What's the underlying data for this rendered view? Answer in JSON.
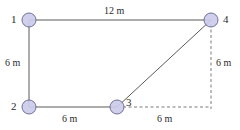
{
  "figure": {
    "units": "m",
    "colors": {
      "node_fill": "#ccccec",
      "node_stroke": "#6f6f9c",
      "member_line": "#5a5a5a",
      "dimension_line": "#7a7a7a",
      "label_text": "#2b2b2b",
      "background": "#ffffff"
    }
  },
  "nodes": [
    {
      "id": "1",
      "label": "1",
      "x": 29,
      "y": 20,
      "r": 7,
      "label_x": 11,
      "label_y": 14
    },
    {
      "id": "2",
      "label": "2",
      "x": 29,
      "y": 107,
      "r": 7,
      "label_x": 11,
      "label_y": 101
    },
    {
      "id": "3",
      "label": "3",
      "x": 117,
      "y": 107,
      "r": 7,
      "label_x": 126,
      "label_y": 97
    },
    {
      "id": "4",
      "label": "4",
      "x": 211,
      "y": 20,
      "r": 7,
      "label_x": 223,
      "label_y": 14
    }
  ],
  "members": [
    {
      "name": "member-1-4",
      "from": "1",
      "to": "4",
      "style": "solid",
      "x1": 29,
      "y1": 20,
      "x2": 211,
      "y2": 20
    },
    {
      "name": "member-1-2",
      "from": "1",
      "to": "2",
      "style": "solid",
      "x1": 29,
      "y1": 20,
      "x2": 29,
      "y2": 107
    },
    {
      "name": "member-2-3",
      "from": "2",
      "to": "3",
      "style": "solid",
      "x1": 29,
      "y1": 107,
      "x2": 117,
      "y2": 107
    },
    {
      "name": "member-3-4",
      "from": "3",
      "to": "4",
      "style": "solid",
      "x1": 117,
      "y1": 107,
      "x2": 211,
      "y2": 20
    }
  ],
  "dimension_lines": [
    {
      "name": "dimension-line-right-vertical",
      "style": "dashed",
      "x1": 211,
      "y1": 24,
      "x2": 211,
      "y2": 109
    },
    {
      "name": "dimension-line-bottom-horizontal",
      "style": "dashed",
      "x1": 123,
      "y1": 107,
      "x2": 211,
      "y2": 107
    }
  ],
  "dimensions": [
    {
      "name": "dimension-label-top",
      "text": "12 m",
      "x": 104,
      "y": 6,
      "for": "member-1-4"
    },
    {
      "name": "dimension-label-left",
      "text": "6 m",
      "x": 5,
      "y": 58,
      "for": "member-1-2"
    },
    {
      "name": "dimension-label-bottom-left",
      "text": "6 m",
      "x": 62,
      "y": 114,
      "for": "member-2-3"
    },
    {
      "name": "dimension-label-bottom-right",
      "text": "6 m",
      "x": 157,
      "y": 114,
      "for": "dimension-line-bottom-horizontal"
    },
    {
      "name": "dimension-label-right",
      "text": "6 m",
      "x": 216,
      "y": 58,
      "for": "dimension-line-right-vertical"
    }
  ],
  "chart_data": {
    "type": "diagram",
    "nodes": [
      "1",
      "2",
      "3",
      "4"
    ],
    "edges": [
      {
        "between": [
          "1",
          "4"
        ],
        "length_m": 12
      },
      {
        "between": [
          "1",
          "2"
        ],
        "length_m": 6
      },
      {
        "between": [
          "2",
          "3"
        ],
        "length_m": 6
      },
      {
        "between": [
          "3",
          "4"
        ],
        "length_m": null
      }
    ],
    "dimensions_m": [
      12,
      6,
      6,
      6,
      6
    ],
    "units": "m"
  }
}
